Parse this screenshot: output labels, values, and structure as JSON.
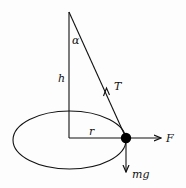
{
  "diagram": {
    "labels": {
      "angle": "α",
      "height": "h",
      "tension": "T",
      "radius": "r",
      "force": "F",
      "weight": "mg"
    },
    "colors": {
      "stroke": "#111111",
      "background": "#fdfdfd"
    }
  }
}
